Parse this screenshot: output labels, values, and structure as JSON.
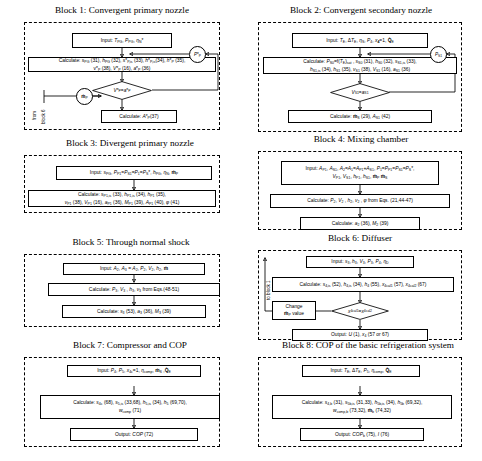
{
  "figure": {
    "type": "flowchart",
    "blocks": [
      {
        "id": "block1",
        "title_prefix": "Block 1:",
        "title": "Block 1: Convergent primary nozzle",
        "title_main": "Convergent primary nozzle",
        "nodes": [
          {
            "kind": "process",
            "name": "input-box",
            "text": "Input: T<sub>PG</sub>, P<sub>PG</sub>, η<sub>N</sub>*"
          },
          {
            "kind": "process",
            "name": "calculate-box",
            "text": "Calculate: s<sub>PG</sub> (31), h<sub>PG</sub> (32), s*<sub>P,is</sub> (33), h*<sub>P,is</sub> (34), h*<sub>P</sub> (35), v*<sub>P</sub> (38), V*<sub>P</sub> (16), a*<sub>P</sub> (36)"
          },
          {
            "kind": "decision",
            "name": "decision-vp-equals-ap",
            "text": "V*<sub>P</sub> = a*<sub>P</sub>"
          },
          {
            "kind": "process",
            "name": "calculate-area-box",
            "text": "Calculate: A*<sub>P</sub> (37)"
          },
          {
            "kind": "connector",
            "name": "connector-p-star-p",
            "text": "P*<sub>P</sub>"
          },
          {
            "kind": "connector",
            "name": "connector-m-dot-p",
            "text": "ṁ<sub>P</sub>"
          }
        ],
        "side_labels": [
          "from",
          "block 6"
        ]
      },
      {
        "id": "block2",
        "title_prefix": "Block 2:",
        "title": "Block 2: Convergent secondary nozzle",
        "title_main": "Convergent secondary nozzle",
        "nodes": [
          {
            "kind": "process",
            "name": "input-box",
            "text": "Input: T<sub>E</sub>, ΔT<sub>E</sub>, η<sub>S</sub>, P<sub>4</sub>, x<sub>4</sub>=1, Q̇<sub>E</sub>"
          },
          {
            "kind": "process",
            "name": "calculate-box",
            "text": "Calculate: P<sub>S0</sub>=f(T<sub>E</sub>)<sub>sat</sub> , s<sub>S0</sub> (31), h<sub>S0</sub> (32), s<sub>S1,is</sub> (33), h<sub>S1,is</sub> (34), h<sub>S1</sub> (35), v<sub>S1</sub> (38), V<sub>S1</sub> (16), a<sub>S1</sub> (36)"
          },
          {
            "kind": "decision",
            "name": "decision-vs1-equals-as1",
            "text": "V<sub>S1</sub> = a<sub>S1</sub>"
          },
          {
            "kind": "process",
            "name": "calculate-mass-area-box",
            "text": "Calculate:  ṁ<sub>S</sub> (29), A<sub>S1</sub> (42)"
          },
          {
            "kind": "connector",
            "name": "connector-p-s1",
            "text": "P<sub>S1</sub>"
          }
        ]
      },
      {
        "id": "block3",
        "title_prefix": "Block 3:",
        "title": "Block 3: Divergent primary nozzle",
        "title_main": "Divergent primary nozzle",
        "nodes": [
          {
            "kind": "process",
            "name": "input-box",
            "text": "Input: s<sub>PG</sub>, P<sub>P1</sub>=P<sub>S1</sub>=P<sub>1</sub>=P<sub>S</sub>*, h<sub>PG</sub>, η<sub>N</sub>, ṁ<sub>P</sub>"
          },
          {
            "kind": "process",
            "name": "calculate-box",
            "text": "Calculate: s<sub>P1,is</sub> (33), h<sub>P1,is</sub> (34), h<sub>P1</sub> (35), v<sub>P1</sub> (38), V<sub>P1</sub> (16), a<sub>P1</sub> (36), M<sub>P1</sub> (39), A<sub>P1</sub> (40), φ (41)"
          }
        ]
      },
      {
        "id": "block4",
        "title_prefix": "Block 4:",
        "title": "Block 4: Mixing chamber",
        "title_main": "Mixing chamber",
        "nodes": [
          {
            "kind": "process",
            "name": "input-box",
            "text": "Input: A<sub>P1</sub>, A<sub>S1</sub>, A<sub>2</sub>=A<sub>1</sub>=A<sub>P1</sub>+A<sub>S1</sub>, P<sub>1</sub>=P<sub>P1</sub>=P<sub>S1</sub>=P<sub>S</sub>*, V<sub>P1</sub>, V<sub>S1</sub>, h<sub>P1</sub>, h<sub>S1</sub>, ṁ<sub>P</sub>, ṁ<sub>S</sub>"
          },
          {
            "kind": "process",
            "name": "calculate-eqs-box",
            "text": "Calculate: P<sub>2</sub>, V<sub>2</sub> , h<sub>2</sub>, v<sub>2</sub> , ϕ from Eqs. (21,44-47)"
          },
          {
            "kind": "process",
            "name": "calculate-a2-m2-box",
            "text": "Calculate: a<sub>2</sub> (36), M<sub>2</sub> (39)"
          }
        ]
      },
      {
        "id": "block5",
        "title_prefix": "Block 5:",
        "title": "Block 5: Through normal shock",
        "title_main": "Through normal shock",
        "nodes": [
          {
            "kind": "process",
            "name": "input-box",
            "text": "Input: A<sub>2</sub>, A<sub>3</sub> = A<sub>2</sub>, P<sub>2</sub>, V<sub>2</sub>, h<sub>2</sub>, ṁ"
          },
          {
            "kind": "process",
            "name": "calculate-eqs-box",
            "text": "Calculate: P<sub>3</sub>, V<sub>3</sub> , h<sub>3</sub>, v<sub>3</sub> from Eqs.(48-51)"
          },
          {
            "kind": "process",
            "name": "calculate-s3-a3-m3-box",
            "text": "Calculate: s<sub>3</sub> (53), a<sub>3</sub> (36), M<sub>3</sub> (39)"
          }
        ]
      },
      {
        "id": "block6",
        "title_prefix": "Block 6:",
        "title": "Block 6: Diffuser",
        "title_main": "Diffuser",
        "nodes": [
          {
            "kind": "process",
            "name": "input-box",
            "text": "Input: s<sub>3</sub>, h<sub>3</sub>, V<sub>3</sub>, P<sub>3</sub>, P<sub>4</sub>, η<sub>D</sub>"
          },
          {
            "kind": "process",
            "name": "calculate-box",
            "text": "Calculate: s<sub>4,is</sub> (52), h<sub>4,is</sub> (34), h<sub>4</sub> (55), x<sub>4cal1</sub> (57), x<sub>4cal2</sub> (67)"
          },
          {
            "kind": "decision",
            "name": "decision-x4cal1-equals-x4cal2",
            "text": "x<sub>4cal1</sub>= x<sub>4cal2</sub>"
          },
          {
            "kind": "process",
            "name": "change-mdot-box",
            "text": "Change ṁ<sub>P</sub> value"
          },
          {
            "kind": "process",
            "name": "output-box",
            "text": "Output: U (1), x<sub>4</sub> (57 or 67)"
          }
        ],
        "side_labels": [
          "to block 1"
        ]
      },
      {
        "id": "block7",
        "title_prefix": "Block 7:",
        "title": "Block 7: Compressor and COP",
        "title_main": "Compressor and",
        "title_italic": "COP",
        "nodes": [
          {
            "kind": "process",
            "name": "input-box",
            "text": "Input: P<sub>4</sub>, P<sub>5</sub>, x<sub>4c</sub>=1, η<sub>comp</sub>, ṁ<sub>S</sub>, Q̇<sub>E</sub>"
          },
          {
            "kind": "process",
            "name": "calculate-box",
            "text": "Calculate: s<sub>4c</sub> (68), s<sub>5,is</sub> (33,68), h<sub>5,is</sub> (34), h<sub>5</sub> (69,70), w<sub>comp</sub> (71)"
          },
          {
            "kind": "process",
            "name": "output-box",
            "text": "Output: COP (72)"
          }
        ]
      },
      {
        "id": "block8",
        "title_prefix": "Block 8:",
        "title": "Block 8: COP of the basic refrigeration system",
        "title_italic": "COP",
        "title_main": "of the basic refrigeration system",
        "nodes": [
          {
            "kind": "process",
            "name": "input-box",
            "text": "Input: T<sub>E</sub>, ΔT<sub>E</sub>, P<sub>5</sub>, η<sub>comp</sub>, Q̇<sub>E</sub>"
          },
          {
            "kind": "process",
            "name": "calculate-box",
            "text": "Calculate: s<sub>4,b</sub> (31), s<sub>5b,is</sub> (31,33), h<sub>5b,is</sub> (34), h<sub>5b</sub> (69,32), w<sub>comp,b</sub> (73,32),  ṁ<sub>b</sub> (74,32)"
          },
          {
            "kind": "process",
            "name": "output-box",
            "text": "Output: COP<sub>b</sub> (75), I (76)"
          }
        ]
      }
    ]
  },
  "colors": {
    "stroke": "#000000",
    "background": "#ffffff"
  }
}
